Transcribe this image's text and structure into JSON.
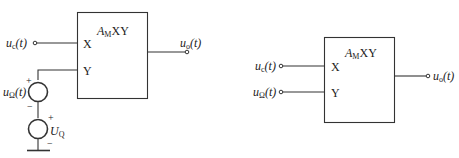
{
  "left_circuit": {
    "block": {
      "gain_symbol": "A",
      "gain_sub": "M",
      "product": "XY",
      "input_x": "X",
      "input_y": "Y"
    },
    "input_carrier": {
      "var": "u",
      "sub": "c",
      "arg": "(t)"
    },
    "output": {
      "var": "u",
      "sub": "o",
      "arg": "(t)"
    },
    "modulating_source": {
      "var": "u",
      "sub": "Ω",
      "arg": "(t)",
      "plus": "+",
      "minus": "−"
    },
    "dc_source": {
      "var": "U",
      "sub": "Q",
      "plus": "+",
      "minus": "−"
    }
  },
  "right_circuit": {
    "block": {
      "gain_symbol": "A",
      "gain_sub": "M",
      "product": "XY",
      "input_x": "X",
      "input_y": "Y"
    },
    "input_carrier": {
      "var": "u",
      "sub": "c",
      "arg": "(t)"
    },
    "input_modulating": {
      "var": "u",
      "sub": "Ω",
      "arg": "(t)"
    },
    "output": {
      "var": "u",
      "sub": "o",
      "arg": "(t)"
    }
  },
  "colors": {
    "line": "#333333",
    "background": "#ffffff"
  }
}
